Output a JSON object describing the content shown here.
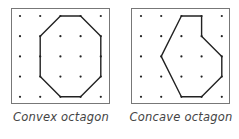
{
  "figures": [
    {
      "caption": "Convex octagon",
      "grid": {
        "cols": 5,
        "rows": 5
      },
      "vertices": [
        [
          2,
          0
        ],
        [
          3,
          0
        ],
        [
          4,
          1
        ],
        [
          4,
          3
        ],
        [
          3,
          4
        ],
        [
          2,
          4
        ],
        [
          1,
          3
        ],
        [
          1,
          1
        ]
      ]
    },
    {
      "caption": "Concave octagon",
      "grid": {
        "cols": 5,
        "rows": 5
      },
      "vertices": [
        [
          2,
          0
        ],
        [
          3,
          0
        ],
        [
          3,
          1
        ],
        [
          4,
          2
        ],
        [
          4,
          3
        ],
        [
          3,
          4
        ],
        [
          2,
          4
        ],
        [
          1,
          2
        ]
      ]
    }
  ],
  "colors": {
    "line": "#222222",
    "dot": "#222222",
    "border": "#777777",
    "caption": "#444444"
  }
}
